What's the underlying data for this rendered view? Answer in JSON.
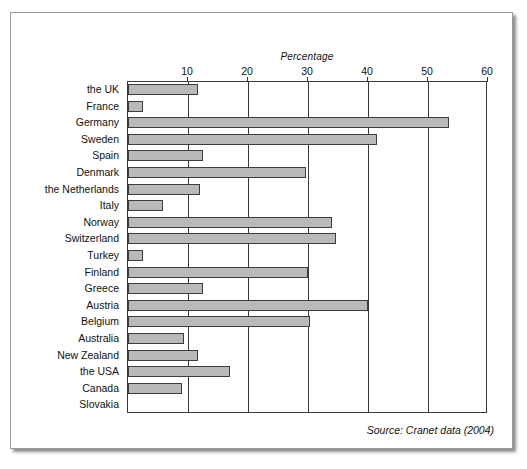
{
  "chart_data": {
    "type": "bar",
    "orientation": "horizontal",
    "title": "",
    "xlabel": "Percentage",
    "ylabel": "",
    "xlim": [
      0,
      60
    ],
    "grid": true,
    "legend": false,
    "source": "Source: Cranet data (2004)",
    "xticks": [
      0,
      10,
      20,
      30,
      40,
      50,
      60
    ],
    "xtick_labels": [
      "",
      "10",
      "20",
      "30",
      "40",
      "50",
      "60"
    ],
    "categories": [
      "the UK",
      "France",
      "Germany",
      "Sweden",
      "Spain",
      "Denmark",
      "the Netherlands",
      "Italy",
      "Norway",
      "Switzerland",
      "Turkey",
      "Finland",
      "Greece",
      "Austria",
      "Belgium",
      "Australia",
      "New Zealand",
      "the USA",
      "Canada",
      "Slovakia"
    ],
    "values": [
      11.7,
      2.5,
      53.5,
      41.5,
      12.5,
      29.7,
      12.0,
      5.8,
      34.0,
      34.7,
      2.5,
      30.0,
      12.5,
      40.0,
      30.3,
      9.4,
      11.6,
      17.0,
      9.0,
      0
    ]
  },
  "colors": {
    "bar_fill": "#b9b9b9",
    "bar_edge": "#3d3d3d",
    "axis": "#3a3a3a",
    "text": "#111111",
    "frame": "#9a9a9a"
  }
}
